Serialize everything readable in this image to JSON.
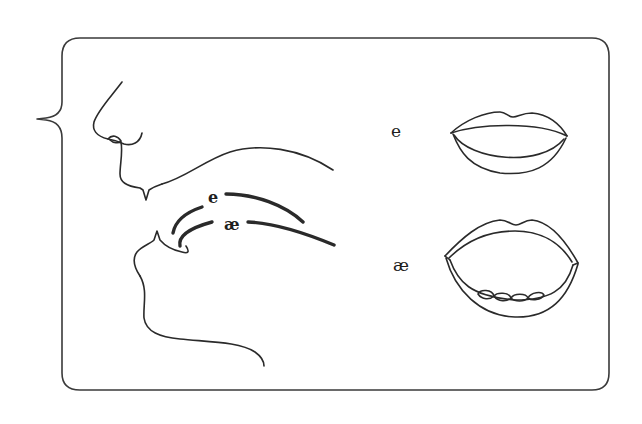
{
  "diagram": {
    "type": "articulation-comparison",
    "frame": {
      "stroke_color": "#3a3a3a",
      "background": "#ffffff"
    },
    "profile": {
      "tongue_labels": [
        {
          "id": "e",
          "text": "e"
        },
        {
          "id": "ae",
          "text": "æ"
        }
      ]
    },
    "lips": [
      {
        "id": "e",
        "label": "e",
        "mouth": "half-open, spread"
      },
      {
        "id": "ae",
        "label": "æ",
        "mouth": "wide open, lower teeth visible"
      }
    ]
  }
}
